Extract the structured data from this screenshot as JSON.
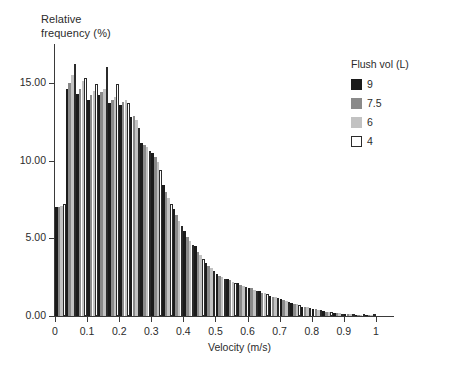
{
  "chart_data": {
    "type": "bar",
    "title": "",
    "xlabel": "Velocity (m/s)",
    "ylabel": "Relative frequency (%)",
    "ylim": [
      0,
      17.5
    ],
    "xlim": [
      0,
      1.05
    ],
    "grid": false,
    "legend_position": "top-right",
    "legend_title": "Flush vol (L)",
    "bar_group_mode": "grouped",
    "bin_width": 0.0333,
    "x_tick_labels": [
      "0",
      "0.1",
      "0.2",
      "0.3",
      "0.4",
      "0.5",
      "0.6",
      "0.7",
      "0.8",
      "0.9",
      "1"
    ],
    "x_tick_values": [
      0,
      0.1,
      0.2,
      0.3,
      0.4,
      0.5,
      0.6,
      0.7,
      0.8,
      0.9,
      1
    ],
    "y_tick_labels": [
      "0.00",
      "5.00",
      "10.00",
      "15.00"
    ],
    "y_tick_values": [
      0,
      5,
      10,
      15
    ],
    "categories": [
      0.017,
      0.05,
      0.083,
      0.117,
      0.15,
      0.183,
      0.217,
      0.25,
      0.283,
      0.317,
      0.35,
      0.383,
      0.417,
      0.45,
      0.483,
      0.517,
      0.55,
      0.583,
      0.617,
      0.65,
      0.683,
      0.717,
      0.75,
      0.783,
      0.817,
      0.85,
      0.883,
      0.917,
      0.95,
      0.983
    ],
    "series": [
      {
        "name": "9",
        "color": "#1b1b1b",
        "border": "#1b1b1b",
        "values": [
          7.0,
          14.6,
          14.3,
          13.9,
          14.2,
          13.7,
          13.6,
          12.8,
          11.1,
          10.5,
          8.4,
          6.9,
          5.5,
          4.5,
          3.4,
          2.7,
          2.4,
          2.1,
          1.8,
          1.6,
          1.3,
          1.1,
          0.85,
          0.6,
          0.45,
          0.3,
          0.2,
          0.14,
          0.09,
          0.05
        ]
      },
      {
        "name": "7.5",
        "color": "#8a8a8a",
        "border": "#8a8a8a",
        "values": [
          7.0,
          15.0,
          14.6,
          14.2,
          14.4,
          13.9,
          13.8,
          12.9,
          11.0,
          10.2,
          8.0,
          6.5,
          5.1,
          4.1,
          3.2,
          2.6,
          2.3,
          2.0,
          1.8,
          1.5,
          1.25,
          1.0,
          0.8,
          0.6,
          0.42,
          0.28,
          0.2,
          0.13,
          0.08,
          0.05
        ]
      },
      {
        "name": "6",
        "color": "#c2c2c2",
        "border": "#c2c2c2",
        "values": [
          7.1,
          15.5,
          15.1,
          14.5,
          14.6,
          14.1,
          13.9,
          12.6,
          10.9,
          9.9,
          7.6,
          6.1,
          4.8,
          3.9,
          3.1,
          2.5,
          2.2,
          1.9,
          1.7,
          1.45,
          1.2,
          0.95,
          0.75,
          0.55,
          0.4,
          0.26,
          0.18,
          0.12,
          0.08,
          0.04
        ]
      },
      {
        "name": "4",
        "color": "#ffffff",
        "border": "#2b2b2b",
        "values": [
          7.2,
          16.2,
          15.3,
          14.9,
          16.0,
          14.9,
          13.7,
          12.1,
          10.6,
          9.4,
          7.2,
          5.8,
          4.6,
          3.7,
          2.9,
          2.4,
          2.1,
          1.85,
          1.6,
          1.4,
          1.15,
          0.9,
          0.7,
          0.5,
          0.36,
          0.24,
          0.16,
          0.11,
          0.07,
          0.04
        ]
      }
    ]
  },
  "axes": {
    "y_title_line1": "Relative",
    "y_title_line2": "frequency (%)"
  }
}
